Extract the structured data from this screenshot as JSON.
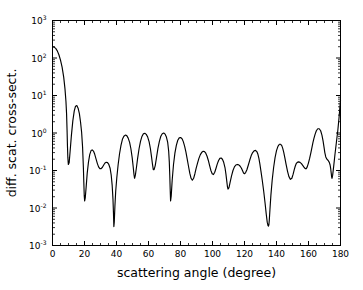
{
  "figure": {
    "background_color": "#ffffff",
    "line_color": "#000000",
    "axis_color": "#000000"
  },
  "chart_data": {
    "type": "line",
    "title": "",
    "subtitle": "",
    "xlabel": "scattering angle (degree)",
    "ylabel": "diff. scat. cross-sect.",
    "xscale": "linear",
    "yscale": "log",
    "xlim": [
      0,
      180
    ],
    "ylim": [
      0.001,
      1000
    ],
    "grid": false,
    "legend": null,
    "legend_position": "none",
    "xticks": [
      0,
      20,
      40,
      60,
      80,
      100,
      120,
      140,
      160,
      180
    ],
    "xticklabels": [
      "0",
      "20",
      "40",
      "60",
      "80",
      "100",
      "120",
      "140",
      "160",
      "180"
    ],
    "yticks": [
      0.001,
      0.01,
      0.1,
      1,
      10,
      100,
      1000
    ],
    "yticklabels": [
      "10-3",
      "10-2",
      "10-1",
      "100",
      "101",
      "102",
      "103"
    ],
    "ytick_mantissa": "10",
    "ytick_exponents": [
      "-3",
      "-2",
      "-1",
      "0",
      "1",
      "2",
      "3"
    ],
    "annotations": [],
    "series": [
      {
        "name": "differential scattering cross-section",
        "color": "#000000",
        "x": [
          0.0,
          1.0,
          2.0,
          3.0,
          4.0,
          5.0,
          6.0,
          7.0,
          7.8,
          8.4,
          8.8,
          9.1,
          9.35,
          9.6,
          9.9,
          10.4,
          11.0,
          11.8,
          12.7,
          13.6,
          14.4,
          15.2,
          16.0,
          16.8,
          17.5,
          18.2,
          18.8,
          19.3,
          19.6,
          19.85,
          20.1,
          20.5,
          21.0,
          21.7,
          22.5,
          23.3,
          24.1,
          24.8,
          25.6,
          26.4,
          27.2,
          28.0,
          28.8,
          29.6,
          30.4,
          31.2,
          32.0,
          32.8,
          33.6,
          34.4,
          35.2,
          36.0,
          36.7,
          37.3,
          37.8,
          38.1,
          38.35,
          38.6,
          39.0,
          39.5,
          40.2,
          41.0,
          41.9,
          42.8,
          43.7,
          44.6,
          45.5,
          46.4,
          47.3,
          48.2,
          49.0,
          49.8,
          50.4,
          50.9,
          51.3,
          51.8,
          52.4,
          53.2,
          54.1,
          55.0,
          55.9,
          56.8,
          57.7,
          58.6,
          59.5,
          60.4,
          61.2,
          61.9,
          62.5,
          63.0,
          63.5,
          64.2,
          65.0,
          65.9,
          66.8,
          67.7,
          68.6,
          69.5,
          70.4,
          71.2,
          72.0,
          72.6,
          73.0,
          73.3,
          73.55,
          73.8,
          74.2,
          74.8,
          75.6,
          76.5,
          77.4,
          78.3,
          79.2,
          80.1,
          81.0,
          81.8,
          82.6,
          83.4,
          84.2,
          85.0,
          85.8,
          86.6,
          87.4,
          88.2,
          89.0,
          89.8,
          90.6,
          91.5,
          92.4,
          93.3,
          94.2,
          95.0,
          95.8,
          96.6,
          97.4,
          98.2,
          99.0,
          99.8,
          100.6,
          101.4,
          102.2,
          103.0,
          103.8,
          104.6,
          105.4,
          106.2,
          107.0,
          107.8,
          108.4,
          108.9,
          109.3,
          109.7,
          110.3,
          111.0,
          111.9,
          112.8,
          113.7,
          114.6,
          115.5,
          116.4,
          117.3,
          118.1,
          118.8,
          119.4,
          120.0,
          120.7,
          121.5,
          122.4,
          123.3,
          124.2,
          125.1,
          126.0,
          126.9,
          127.7,
          128.4,
          129.0,
          129.6,
          130.3,
          131.1,
          132.0,
          132.9,
          133.6,
          134.2,
          134.7,
          135.0,
          135.25,
          135.5,
          135.9,
          136.5,
          137.3,
          138.2,
          139.1,
          140.0,
          140.9,
          141.8,
          142.6,
          143.3,
          143.9,
          144.5,
          145.2,
          146.0,
          146.9,
          147.8,
          148.7,
          149.6,
          150.4,
          151.1,
          151.7,
          152.3,
          153.0,
          153.8,
          154.7,
          155.6,
          156.5,
          157.3,
          158.0,
          158.6,
          159.2,
          159.9,
          160.7,
          161.5,
          162.2,
          162.8,
          163.4,
          164.1,
          164.9,
          165.8,
          166.7,
          167.6,
          168.4,
          169.1,
          169.7,
          170.2,
          170.8,
          171.5,
          172.3,
          173.0,
          173.5,
          173.9,
          174.2,
          174.45,
          174.7,
          175.1,
          175.7,
          176.5,
          177.4,
          178.3,
          179.1,
          180.0
        ],
        "y": [
          200.0,
          195.0,
          180.0,
          155.0,
          122.0,
          88.0,
          57.0,
          31.0,
          15.0,
          7.0,
          3.2,
          1.2,
          0.45,
          0.22,
          0.145,
          0.16,
          0.32,
          0.85,
          2.1,
          3.9,
          5.2,
          5.4,
          4.6,
          3.3,
          2.0,
          1.05,
          0.42,
          0.12,
          0.045,
          0.021,
          0.0155,
          0.019,
          0.035,
          0.085,
          0.17,
          0.27,
          0.34,
          0.355,
          0.33,
          0.27,
          0.205,
          0.155,
          0.125,
          0.112,
          0.112,
          0.122,
          0.14,
          0.158,
          0.166,
          0.162,
          0.145,
          0.115,
          0.075,
          0.04,
          0.017,
          0.0075,
          0.0032,
          0.0042,
          0.011,
          0.028,
          0.065,
          0.14,
          0.28,
          0.47,
          0.68,
          0.82,
          0.88,
          0.85,
          0.73,
          0.56,
          0.38,
          0.22,
          0.13,
          0.08,
          0.062,
          0.075,
          0.115,
          0.21,
          0.38,
          0.6,
          0.81,
          0.95,
          0.98,
          0.92,
          0.78,
          0.58,
          0.38,
          0.23,
          0.145,
          0.105,
          0.105,
          0.135,
          0.22,
          0.39,
          0.6,
          0.82,
          0.96,
          1.0,
          0.93,
          0.78,
          0.56,
          0.33,
          0.17,
          0.075,
          0.032,
          0.0155,
          0.021,
          0.055,
          0.14,
          0.29,
          0.47,
          0.64,
          0.74,
          0.76,
          0.7,
          0.58,
          0.44,
          0.31,
          0.2,
          0.13,
          0.085,
          0.062,
          0.055,
          0.062,
          0.082,
          0.115,
          0.155,
          0.21,
          0.265,
          0.305,
          0.325,
          0.32,
          0.29,
          0.24,
          0.185,
          0.135,
          0.1,
          0.082,
          0.078,
          0.09,
          0.115,
          0.15,
          0.185,
          0.21,
          0.215,
          0.2,
          0.165,
          0.12,
          0.08,
          0.053,
          0.038,
          0.032,
          0.035,
          0.048,
          0.072,
          0.1,
          0.125,
          0.14,
          0.145,
          0.142,
          0.13,
          0.115,
          0.098,
          0.086,
          0.082,
          0.088,
          0.105,
          0.14,
          0.19,
          0.25,
          0.3,
          0.335,
          0.345,
          0.32,
          0.27,
          0.21,
          0.15,
          0.095,
          0.055,
          0.028,
          0.013,
          0.0068,
          0.0042,
          0.0034,
          0.0033,
          0.0036,
          0.0048,
          0.009,
          0.022,
          0.055,
          0.12,
          0.22,
          0.34,
          0.44,
          0.5,
          0.5,
          0.46,
          0.39,
          0.31,
          0.22,
          0.145,
          0.095,
          0.068,
          0.058,
          0.062,
          0.08,
          0.105,
          0.13,
          0.152,
          0.165,
          0.17,
          0.165,
          0.152,
          0.135,
          0.12,
          0.112,
          0.112,
          0.125,
          0.155,
          0.21,
          0.3,
          0.42,
          0.56,
          0.72,
          0.92,
          1.15,
          1.3,
          1.3,
          1.15,
          0.88,
          0.62,
          0.42,
          0.3,
          0.23,
          0.2,
          0.185,
          0.165,
          0.14,
          0.11,
          0.085,
          0.068,
          0.062,
          0.075,
          0.125,
          0.26,
          0.55,
          1.15,
          2.6,
          7.5
        ]
      }
    ]
  },
  "axes": {
    "x_axis_name": "scattering-angle-axis",
    "y_axis_name": "cross-section-axis"
  }
}
